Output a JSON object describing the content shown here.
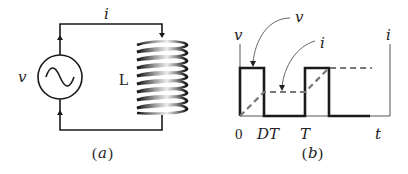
{
  "panel_a": {
    "current_label": "i",
    "source_label": "v",
    "inductor_label": "L",
    "caption_open": "(",
    "caption_letter": "a",
    "caption_close": ")"
  },
  "panel_b": {
    "left_axis_label": "v",
    "right_axis_label": "i",
    "pointer_v_label": "v",
    "pointer_i_label": "i",
    "tick_0": "0",
    "tick_dt": "DT",
    "tick_t": "T",
    "axis_t": "t",
    "caption_open": "(",
    "caption_letter": "b",
    "caption_close": ")"
  },
  "colors": {
    "line": "#1a1a1a",
    "dashed": "#777777",
    "axis": "#555555"
  }
}
